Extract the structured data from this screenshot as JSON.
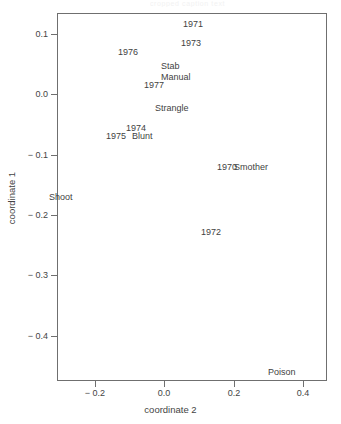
{
  "figure": {
    "header_fragment": "cropped caption text",
    "background_color": "#ffffff",
    "frame_color": "#6f6f6f",
    "text_color": "#3f3f3f"
  },
  "chart_data": {
    "type": "scatter",
    "title": "",
    "xlabel": "coordinate 2",
    "ylabel": "coordinate 1",
    "xlim": [
      -0.31,
      0.47
    ],
    "ylim": [
      -0.475,
      0.135
    ],
    "xticks": [
      -0.2,
      0.0,
      0.2,
      0.4
    ],
    "xticklabels": [
      "− 0.2",
      "0.0",
      "0.2",
      "0.4"
    ],
    "yticks": [
      0.1,
      0.0,
      -0.1,
      -0.2,
      -0.3,
      -0.4
    ],
    "yticklabels": [
      "0.1",
      "0.0",
      "− 0.1",
      "− 0.2",
      "− 0.3",
      "− 0.4"
    ],
    "grid": false,
    "legend": null,
    "marker": "text-label",
    "points": [
      {
        "label": "1971",
        "x": 0.082,
        "y": 0.116,
        "group": "year"
      },
      {
        "label": "1973",
        "x": 0.077,
        "y": 0.085,
        "group": "year"
      },
      {
        "label": "1976",
        "x": -0.104,
        "y": 0.071,
        "group": "year"
      },
      {
        "label": "Stab",
        "x": 0.019,
        "y": 0.047,
        "group": "method"
      },
      {
        "label": "Manual",
        "x": 0.035,
        "y": 0.029,
        "group": "method"
      },
      {
        "label": "1977",
        "x": -0.031,
        "y": 0.015,
        "group": "year"
      },
      {
        "label": "Strangle",
        "x": 0.022,
        "y": -0.023,
        "group": "method"
      },
      {
        "label": "1974",
        "x": -0.082,
        "y": -0.055,
        "group": "year"
      },
      {
        "label": "1975",
        "x": -0.141,
        "y": -0.069,
        "group": "year"
      },
      {
        "label": "Blunt",
        "x": -0.062,
        "y": -0.069,
        "group": "method"
      },
      {
        "label": "1970",
        "x": 0.18,
        "y": -0.121,
        "group": "year"
      },
      {
        "label": "Smother",
        "x": 0.251,
        "y": -0.121,
        "group": "method"
      },
      {
        "label": "Shoot",
        "x": -0.298,
        "y": -0.17,
        "group": "method"
      },
      {
        "label": "1972",
        "x": 0.134,
        "y": -0.228,
        "group": "year"
      },
      {
        "label": "Poison",
        "x": 0.34,
        "y": -0.46,
        "group": "method"
      }
    ]
  },
  "axes": {
    "x_title": "coordinate 2",
    "y_title": "coordinate 1"
  }
}
